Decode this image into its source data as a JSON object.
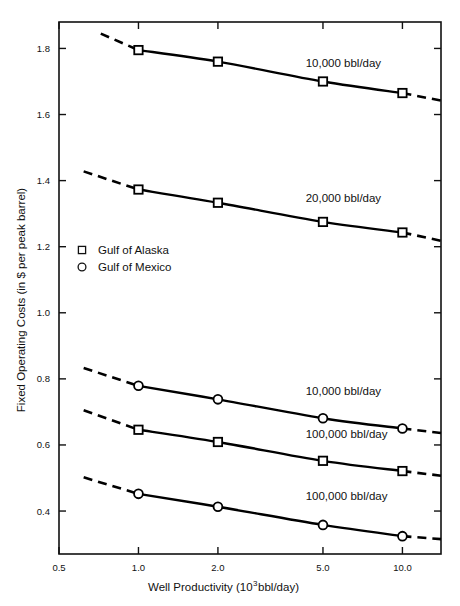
{
  "chart_data": {
    "type": "line",
    "title": "",
    "xlabel": "Well Productivity (10³ bbl/day)",
    "xlabel_base": "Well Productivity (10",
    "xlabel_exp": "3",
    "xlabel_tail": " bbl/day)",
    "ylabel": "Fixed Operating Costs (in $ per peak barrel)",
    "xscale": "log",
    "xlim": [
      0.5,
      14.0
    ],
    "ylim": [
      0.27,
      1.88
    ],
    "xticks": [
      0.5,
      1.0,
      2.0,
      5.0,
      10.0
    ],
    "xtick_labels": [
      "0.5",
      "1.0",
      "2.0",
      "5.0",
      "10.0"
    ],
    "yticks": [
      0.4,
      0.6,
      0.8,
      1.0,
      1.2,
      1.4,
      1.6,
      1.8
    ],
    "ytick_labels": [
      "0.4",
      "0.6",
      "0.8",
      "1.0",
      "1.2",
      "1.4",
      "1.6",
      "1.8"
    ],
    "grid": false,
    "legend_position": "middle-left",
    "legend": [
      {
        "marker": "square",
        "label": "Gulf of Alaska"
      },
      {
        "marker": "circle",
        "label": "Gulf of Mexico"
      }
    ],
    "series": [
      {
        "name": "Gulf of Alaska 10,000 bbl/day",
        "marker": "square",
        "annotation": "10,000 bbl/day",
        "annotation_x": 4.3,
        "annotation_y": 1.745,
        "x": [
          1.0,
          2.0,
          5.0,
          10.0
        ],
        "values": [
          1.795,
          1.76,
          1.7,
          1.665
        ],
        "extrapolate_low": {
          "x": [
            0.72,
            1.0
          ],
          "values": [
            1.845,
            1.795
          ]
        },
        "extrapolate_high": {
          "x": [
            10.0,
            14.0
          ],
          "values": [
            1.665,
            1.642
          ]
        }
      },
      {
        "name": "Gulf of Alaska 20,000 bbl/day",
        "marker": "square",
        "annotation": "20,000 bbl/day",
        "annotation_x": 4.3,
        "annotation_y": 1.335,
        "x": [
          1.0,
          2.0,
          5.0,
          10.0
        ],
        "values": [
          1.373,
          1.333,
          1.275,
          1.243
        ],
        "extrapolate_low": {
          "x": [
            0.62,
            1.0
          ],
          "values": [
            1.428,
            1.373
          ]
        },
        "extrapolate_high": {
          "x": [
            10.0,
            14.0
          ],
          "values": [
            1.243,
            1.218
          ]
        }
      },
      {
        "name": "Gulf of Mexico 10,000 bbl/day",
        "marker": "circle",
        "annotation": "10,000 bbl/day",
        "annotation_x": 4.3,
        "annotation_y": 0.752,
        "x": [
          1.0,
          2.0,
          5.0,
          10.0
        ],
        "values": [
          0.779,
          0.738,
          0.681,
          0.65
        ],
        "extrapolate_low": {
          "x": [
            0.62,
            1.0
          ],
          "values": [
            0.833,
            0.779
          ]
        },
        "extrapolate_high": {
          "x": [
            10.0,
            14.0
          ],
          "values": [
            0.65,
            0.636
          ]
        }
      },
      {
        "name": "Gulf of Alaska 100,000 bbl/day",
        "marker": "square",
        "annotation": "100,000 bbl/day",
        "annotation_x": 4.3,
        "annotation_y": 0.622,
        "x": [
          1.0,
          2.0,
          5.0,
          10.0
        ],
        "values": [
          0.646,
          0.609,
          0.552,
          0.521
        ],
        "extrapolate_low": {
          "x": [
            0.62,
            1.0
          ],
          "values": [
            0.705,
            0.646
          ]
        },
        "extrapolate_high": {
          "x": [
            10.0,
            14.0
          ],
          "values": [
            0.521,
            0.507
          ]
        }
      },
      {
        "name": "Gulf of Mexico 100,000 bbl/day",
        "marker": "circle",
        "annotation": "100,000 bbl/day",
        "annotation_x": 4.3,
        "annotation_y": 0.432,
        "x": [
          1.0,
          2.0,
          5.0,
          10.0
        ],
        "values": [
          0.452,
          0.413,
          0.358,
          0.324
        ],
        "extrapolate_low": {
          "x": [
            0.62,
            1.0
          ],
          "values": [
            0.502,
            0.452
          ]
        },
        "extrapolate_high": {
          "x": [
            10.0,
            14.0
          ],
          "values": [
            0.324,
            0.315
          ]
        }
      }
    ]
  },
  "colors": {
    "ink": "#111111",
    "curve": "#000000",
    "background": "#ffffff"
  }
}
